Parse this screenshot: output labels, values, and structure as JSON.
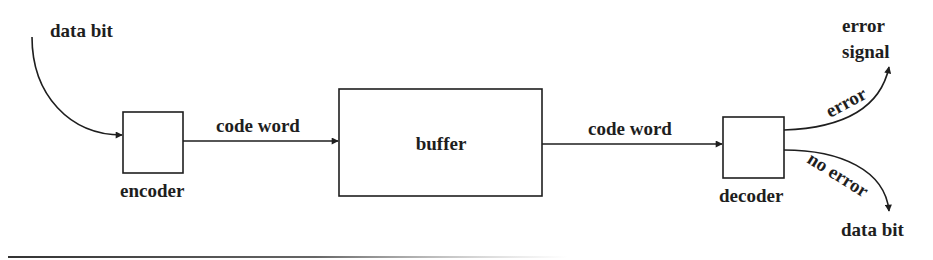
{
  "diagram": {
    "type": "block-diagram",
    "colors": {
      "stroke": "#1e1e1e",
      "background": "#ffffff"
    },
    "input": {
      "label": "data bit"
    },
    "blocks": [
      {
        "id": "encoder",
        "label": "encoder"
      },
      {
        "id": "buffer",
        "label": "buffer"
      },
      {
        "id": "decoder",
        "label": "decoder"
      }
    ],
    "edges": [
      {
        "from": "input",
        "to": "encoder",
        "label": ""
      },
      {
        "from": "encoder",
        "to": "buffer",
        "label": "code word"
      },
      {
        "from": "buffer",
        "to": "decoder",
        "label": "code word"
      },
      {
        "from": "decoder",
        "to": "error-output",
        "label": "error"
      },
      {
        "from": "decoder",
        "to": "data-output",
        "label": "no error"
      }
    ],
    "outputs": {
      "error": {
        "line1": "error",
        "line2": "signal"
      },
      "data": {
        "label": "data bit"
      }
    }
  }
}
